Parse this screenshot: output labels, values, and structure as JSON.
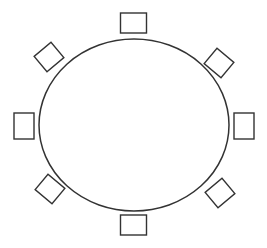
{
  "diagram": {
    "title": "",
    "background": "#ffffff",
    "stroke_color": "#333333",
    "table": {
      "shape": "ellipse",
      "cx": 134,
      "cy": 125,
      "rx": 95,
      "ry": 86
    },
    "chairs": [
      {
        "position": "top",
        "cx": 133.5,
        "cy": 23,
        "w": 26,
        "h": 20,
        "rotate": 0
      },
      {
        "position": "top-right",
        "cx": 219,
        "cy": 63,
        "w": 22,
        "h": 20,
        "rotate": 40
      },
      {
        "position": "right",
        "cx": 244,
        "cy": 126,
        "w": 20,
        "h": 26,
        "rotate": 0
      },
      {
        "position": "bottom-right",
        "cx": 220,
        "cy": 193,
        "w": 22,
        "h": 20,
        "rotate": -40
      },
      {
        "position": "bottom",
        "cx": 133.5,
        "cy": 225,
        "w": 26,
        "h": 20,
        "rotate": 0
      },
      {
        "position": "bottom-left",
        "cx": 50,
        "cy": 189,
        "w": 22,
        "h": 20,
        "rotate": 40
      },
      {
        "position": "left",
        "cx": 24,
        "cy": 126,
        "w": 20,
        "h": 26,
        "rotate": 0
      },
      {
        "position": "top-left",
        "cx": 49,
        "cy": 57,
        "w": 22,
        "h": 20,
        "rotate": -40
      }
    ]
  }
}
